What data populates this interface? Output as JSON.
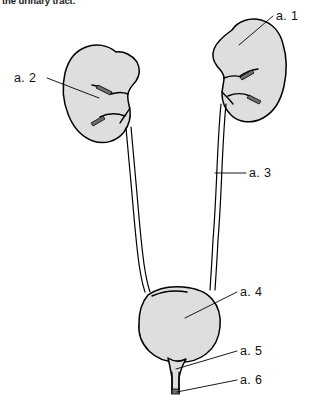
{
  "figure": {
    "caption": "the urinary tract.",
    "background_color": "#ffffff",
    "ink_color": "#000000",
    "organ_fill_color": "#dededd",
    "width": 313,
    "height": 395
  },
  "labels": [
    {
      "id": "a1",
      "text": "a. 1",
      "x": 276,
      "y": 20,
      "target": "right-kidney"
    },
    {
      "id": "a2",
      "text": "a. 2",
      "x": 14,
      "y": 82,
      "target": "left-kidney"
    },
    {
      "id": "a3",
      "text": "a. 3",
      "x": 249,
      "y": 177,
      "target": "ureter"
    },
    {
      "id": "a4",
      "text": "a. 4",
      "x": 240,
      "y": 296,
      "target": "bladder"
    },
    {
      "id": "a5",
      "text": "a. 5",
      "x": 240,
      "y": 355,
      "target": "bladder-neck"
    },
    {
      "id": "a6",
      "text": "a. 6",
      "x": 240,
      "y": 384,
      "target": "urethra"
    }
  ],
  "structures": [
    {
      "id": "right-kidney",
      "name": "right kidney"
    },
    {
      "id": "left-kidney",
      "name": "left kidney"
    },
    {
      "id": "right-ureter",
      "name": "right ureter"
    },
    {
      "id": "left-ureter",
      "name": "left ureter"
    },
    {
      "id": "bladder",
      "name": "urinary bladder"
    },
    {
      "id": "urethra",
      "name": "urethra"
    }
  ]
}
